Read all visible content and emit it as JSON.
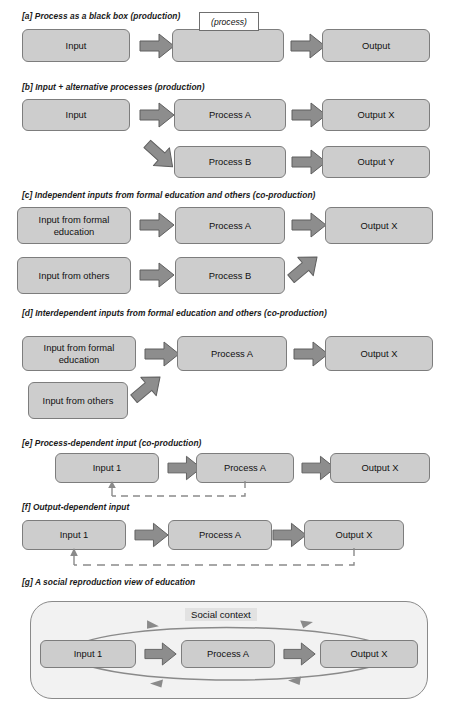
{
  "figure": {
    "title_note": "Models of education production and co-production",
    "box_fill": "#cdcdcd",
    "box_stroke": "#7d7d7d",
    "arrow_fill": "#8d8d8d",
    "arrow_stroke": "#5f5f5f",
    "social_fill": "#f2f2f2",
    "social_stroke": "#8a8a8a",
    "loop_stroke": "#8a8a8a",
    "dash_stroke": "#8a8a8a"
  },
  "panels": [
    {
      "key": "a",
      "caption": "[a] Process as a black box (production)",
      "nodes": [
        {
          "name": "input",
          "label": "Input"
        },
        {
          "name": "process",
          "label": ""
        },
        {
          "name": "output",
          "label": "Output"
        }
      ],
      "tag": "(process)",
      "arrows": [
        "right",
        "right"
      ]
    },
    {
      "key": "b",
      "caption": "[b] Input + alternative processes (production)",
      "nodes": [
        {
          "name": "input",
          "label": "Input"
        },
        {
          "name": "process-a",
          "label": "Process A"
        },
        {
          "name": "output-x",
          "label": "Output X"
        },
        {
          "name": "process-b",
          "label": "Process B"
        },
        {
          "name": "output-y",
          "label": "Output Y"
        }
      ],
      "arrows": [
        "right",
        "right",
        "down-right",
        "right"
      ]
    },
    {
      "key": "c",
      "caption": "[c] Independent inputs from formal education and others (co-production)",
      "nodes": [
        {
          "name": "input-formal-education",
          "label": "Input from formal education"
        },
        {
          "name": "process-a",
          "label": "Process A"
        },
        {
          "name": "output-x",
          "label": "Output X"
        },
        {
          "name": "input-others",
          "label": "Input from others"
        },
        {
          "name": "process-b",
          "label": "Process B"
        }
      ],
      "arrows": [
        "right",
        "right",
        "right",
        "up-right"
      ]
    },
    {
      "key": "d",
      "caption": "[d] Interdependent inputs from formal education and others (co-production)",
      "nodes": [
        {
          "name": "input-formal-education",
          "label": "Input from formal education"
        },
        {
          "name": "process-a",
          "label": "Process A"
        },
        {
          "name": "output-x",
          "label": "Output X"
        },
        {
          "name": "input-others",
          "label": "Input from others"
        }
      ],
      "arrows": [
        "right",
        "right",
        "up-right"
      ]
    },
    {
      "key": "e",
      "caption": "[e] Process-dependent input (co-production)",
      "nodes": [
        {
          "name": "input-1",
          "label": "Input 1"
        },
        {
          "name": "process-a",
          "label": "Process A"
        },
        {
          "name": "output-x",
          "label": "Output X"
        }
      ],
      "arrows": [
        "right",
        "right"
      ],
      "feedback": {
        "from": "process-a",
        "to": "input-1",
        "style": "dashed"
      }
    },
    {
      "key": "f",
      "caption": "[f] Output-dependent input",
      "nodes": [
        {
          "name": "input-1",
          "label": "Input 1"
        },
        {
          "name": "process-a",
          "label": "Process A"
        },
        {
          "name": "output-x",
          "label": "Output X"
        }
      ],
      "arrows": [
        "right",
        "right"
      ],
      "feedback": {
        "from": "output-x",
        "to": "input-1",
        "style": "dashed"
      }
    },
    {
      "key": "g",
      "caption": "[g] A social reproduction view of education",
      "container_label": "Social context",
      "nodes": [
        {
          "name": "input-1",
          "label": "Input 1"
        },
        {
          "name": "process-a",
          "label": "Process A"
        },
        {
          "name": "output-x",
          "label": "Output X"
        }
      ],
      "arrows": [
        "right",
        "right"
      ],
      "loops": [
        {
          "name": "top-loop",
          "direction": "input-to-output"
        },
        {
          "name": "bottom-loop",
          "direction": "output-to-input"
        }
      ]
    }
  ]
}
